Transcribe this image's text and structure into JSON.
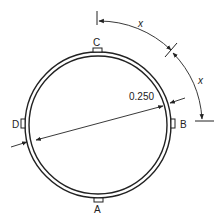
{
  "diagram": {
    "labels": {
      "top": "C",
      "right": "B",
      "bottom": "A",
      "left": "D"
    },
    "dimension": "0.250",
    "arc_labels": [
      "x",
      "x"
    ],
    "colors": {
      "line": "#222222",
      "background": "#ffffff"
    }
  }
}
